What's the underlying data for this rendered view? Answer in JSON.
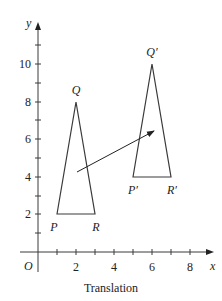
{
  "figure": {
    "caption": "Translation",
    "axes": {
      "x_label": "x",
      "y_label": "y",
      "origin_label": "O",
      "x_ticks": [
        1,
        2,
        3,
        4,
        5,
        6,
        7,
        8
      ],
      "x_tick_labels": [
        "2",
        "4",
        "6",
        "8"
      ],
      "y_ticks": [
        1,
        2,
        3,
        4,
        5,
        6,
        7,
        8,
        9,
        10,
        11
      ],
      "y_tick_labels": [
        "2",
        "4",
        "6",
        "8",
        "10"
      ]
    },
    "original_triangle": {
      "name": "PQR",
      "vertices": [
        {
          "label": "P",
          "x": 1,
          "y": 2
        },
        {
          "label": "Q",
          "x": 2,
          "y": 8
        },
        {
          "label": "R",
          "x": 3,
          "y": 2
        }
      ]
    },
    "image_triangle": {
      "name": "P'Q'R'",
      "vertices": [
        {
          "label": "P′",
          "x": 5,
          "y": 4
        },
        {
          "label": "Q′",
          "x": 6,
          "y": 10
        },
        {
          "label": "R′",
          "x": 7,
          "y": 4
        }
      ]
    },
    "translation_vector": {
      "dx": 4,
      "dy": 2
    }
  }
}
